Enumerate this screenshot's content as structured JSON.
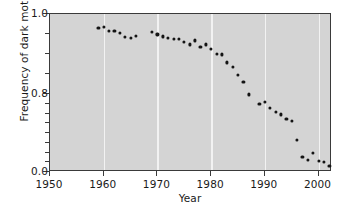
{
  "chart_data": {
    "type": "scatter",
    "title": "",
    "xlabel": "Year",
    "ylabel": "Frequency of dark moths",
    "xlim": [
      1950,
      2002.5
    ],
    "ylim": [
      0.0,
      1.0
    ],
    "grid": "vertical-white-at-decades",
    "legend": "none",
    "axis_note": "y-axis uses a broken/compressed scale: 1.0-0.8 occupies the upper half, 0.8-0.0 the lower half",
    "xticks": [
      1950,
      1960,
      1970,
      1980,
      1990,
      2000
    ],
    "xtick_labels": [
      "1950",
      "1960",
      "1970",
      "1980",
      "1990",
      "2000"
    ],
    "yticks": [
      1.0,
      0.8,
      0.0
    ],
    "ytick_labels": [
      "1.0",
      "0.8",
      "0.0"
    ],
    "yminor_upper": [
      0.95,
      0.9,
      0.85
    ],
    "yminor_lower": [
      0.7,
      0.6,
      0.5,
      0.4,
      0.3,
      0.2,
      0.1
    ],
    "marker": {
      "shape": "circle",
      "color": "#141414",
      "size_px": 3.2
    },
    "plot_background": "#d4d4d4",
    "gridline_color": "#f2f2f2",
    "axis_color": "#3a3a3a",
    "x": [
      1959,
      1960,
      1961,
      1962,
      1963,
      1964,
      1965,
      1966,
      1969,
      1970,
      1971,
      1972,
      1973,
      1974,
      1975,
      1976,
      1977,
      1978,
      1979,
      1980,
      1981,
      1982,
      1983,
      1984,
      1985,
      1986,
      1987,
      1989,
      1990,
      1991,
      1992,
      1993,
      1994,
      1995,
      1996,
      1997,
      1998,
      1999,
      2000,
      2001,
      2002
    ],
    "y": [
      0.965,
      0.968,
      0.957,
      0.958,
      0.952,
      0.943,
      0.941,
      0.946,
      0.955,
      0.949,
      0.944,
      0.941,
      0.938,
      0.937,
      0.93,
      0.924,
      0.934,
      0.918,
      0.924,
      0.912,
      0.901,
      0.899,
      0.879,
      0.868,
      0.848,
      0.83,
      0.795,
      0.7,
      0.715,
      0.66,
      0.62,
      0.59,
      0.545,
      0.525,
      0.33,
      0.155,
      0.12,
      0.195,
      0.11,
      0.105,
      0.06
    ]
  }
}
